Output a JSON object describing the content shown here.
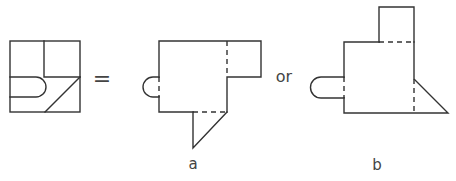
{
  "diagram": {
    "line_color": "#333333",
    "operators": {
      "equals": "=",
      "or": "or"
    },
    "figures": [
      {
        "id": "source",
        "label": ""
      },
      {
        "id": "a",
        "label": "a"
      },
      {
        "id": "b",
        "label": "b"
      }
    ]
  }
}
